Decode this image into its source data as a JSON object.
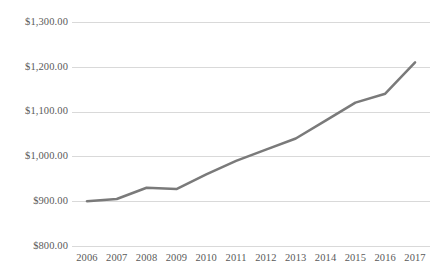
{
  "chart_data": {
    "type": "line",
    "title": "",
    "subtitle": "",
    "xlabel": "",
    "ylabel": "",
    "categories": [
      "2006",
      "2007",
      "2008",
      "2009",
      "2010",
      "2011",
      "2012",
      "2013",
      "2014",
      "2015",
      "2016",
      "2017"
    ],
    "series": [
      {
        "name": "",
        "values": [
          900,
          905,
          930,
          927,
          960,
          990,
          1015,
          1040,
          1080,
          1120,
          1140,
          1210
        ],
        "color": "#7a7a7a"
      }
    ],
    "ylim": [
      800,
      1300
    ],
    "ytick_values": [
      1300,
      1200,
      1100,
      1000,
      900,
      800
    ],
    "ytick_labels": [
      "$1,300.00",
      "$1,200.00",
      "$1,100.00",
      "$1,000.00",
      "$900.00",
      "$800.00"
    ],
    "xtick_labels": [
      "2006",
      "2007",
      "2008",
      "2009",
      "2010",
      "2011",
      "2012",
      "2013",
      "2014",
      "2015",
      "2016",
      "2017"
    ],
    "grid": {
      "horizontal": true,
      "vertical": false,
      "color": "#d9d9d9"
    },
    "legend": {
      "visible": false,
      "position": "none",
      "entries": []
    },
    "markers": false,
    "line_width": 2.5,
    "annotations": [],
    "axis_label_color": "#5a5a5a",
    "background_color": "#ffffff",
    "plot_border": false
  }
}
